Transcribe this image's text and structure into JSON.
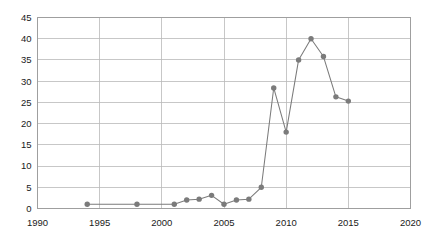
{
  "chart_data": {
    "type": "line",
    "title": "",
    "subtitle": "",
    "xlabel": "",
    "ylabel": "",
    "xlim": [
      1990,
      2020
    ],
    "ylim": [
      0,
      45
    ],
    "grid": true,
    "legend": false,
    "legend_position": "none",
    "marker": "circle",
    "series_color": "#7b7b7b",
    "grid_color": "#b9b9b9",
    "background_color": "#ffffff",
    "x_ticks": [
      1990,
      1995,
      2000,
      2005,
      2010,
      2015,
      2020
    ],
    "x_tick_labels": [
      "1990",
      "1995",
      "2000",
      "2005",
      "2010",
      "2015",
      "2020"
    ],
    "y_ticks": [
      0,
      5,
      10,
      15,
      20,
      25,
      30,
      35,
      40,
      45
    ],
    "y_tick_labels": [
      "0",
      "5",
      "10",
      "15",
      "20",
      "25",
      "30",
      "35",
      "40",
      "45"
    ],
    "x": [
      1994,
      1998,
      2001,
      2002,
      2003,
      2004,
      2005,
      2006,
      2007,
      2008,
      2009,
      2010,
      2011,
      2012,
      2013,
      2014,
      2015
    ],
    "values": [
      1,
      1,
      1,
      2,
      2.2,
      3.1,
      1,
      2,
      2.2,
      5,
      28.4,
      18,
      35,
      40,
      35.8,
      26.3,
      25.3
    ],
    "series": [
      {
        "name": "",
        "color": "#7b7b7b",
        "points": [
          {
            "x": 1994,
            "y": 1
          },
          {
            "x": 1998,
            "y": 1
          },
          {
            "x": 2001,
            "y": 1
          },
          {
            "x": 2002,
            "y": 2
          },
          {
            "x": 2003,
            "y": 2.2
          },
          {
            "x": 2004,
            "y": 3.1
          },
          {
            "x": 2005,
            "y": 1
          },
          {
            "x": 2006,
            "y": 2
          },
          {
            "x": 2007,
            "y": 2.2
          },
          {
            "x": 2008,
            "y": 5
          },
          {
            "x": 2009,
            "y": 28.4
          },
          {
            "x": 2010,
            "y": 18
          },
          {
            "x": 2011,
            "y": 35
          },
          {
            "x": 2012,
            "y": 40
          },
          {
            "x": 2013,
            "y": 35.8
          },
          {
            "x": 2014,
            "y": 26.3
          },
          {
            "x": 2015,
            "y": 25.3
          }
        ]
      }
    ]
  }
}
